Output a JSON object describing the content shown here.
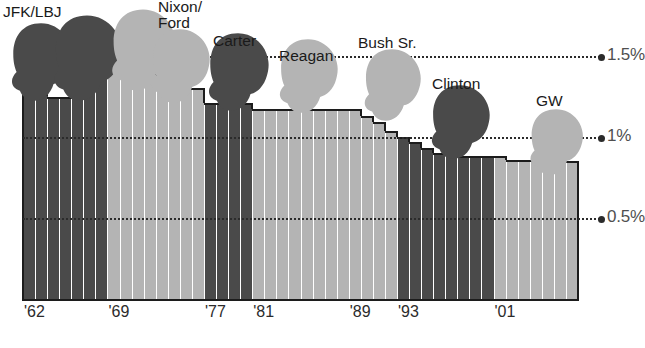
{
  "chart_data": {
    "type": "bar",
    "title_fragment_visible": "",
    "xlabel": "",
    "ylabel": "",
    "ylim": [
      0,
      1.75
    ],
    "grid": true,
    "legend_position": "none",
    "ytick_labels": [
      "1.5%",
      "1%",
      "0.5%"
    ],
    "ytick_values": [
      1.5,
      1.0,
      0.5
    ],
    "xtick_labels": [
      "'62",
      "'69",
      "'77",
      "'81",
      "'89",
      "'93",
      "'01"
    ],
    "xtick_years": [
      1962,
      1969,
      1977,
      1981,
      1989,
      1993,
      2001
    ],
    "x": [
      1962,
      1963,
      1964,
      1965,
      1966,
      1967,
      1968,
      1969,
      1970,
      1971,
      1972,
      1973,
      1974,
      1975,
      1976,
      1977,
      1978,
      1979,
      1980,
      1981,
      1982,
      1983,
      1984,
      1985,
      1986,
      1987,
      1988,
      1989,
      1990,
      1991,
      1992,
      1993,
      1994,
      1995,
      1996,
      1997,
      1998,
      1999,
      2000,
      2001,
      2002,
      2003,
      2004,
      2005,
      2006,
      2007
    ],
    "values": [
      1.33,
      1.33,
      1.25,
      1.25,
      1.25,
      1.4,
      1.4,
      1.52,
      1.52,
      1.52,
      1.46,
      1.38,
      1.38,
      1.3,
      1.3,
      1.21,
      1.21,
      1.21,
      1.21,
      1.17,
      1.17,
      1.17,
      1.17,
      1.17,
      1.17,
      1.17,
      1.17,
      1.17,
      1.13,
      1.09,
      1.04,
      1.0,
      0.97,
      0.93,
      0.9,
      0.9,
      0.88,
      0.88,
      0.88,
      0.88,
      0.86,
      0.86,
      0.86,
      0.85,
      0.85,
      0.85
    ],
    "series": [
      {
        "name": "Annual population growth rate",
        "values": [
          1.33,
          1.33,
          1.25,
          1.25,
          1.25,
          1.4,
          1.4,
          1.52,
          1.52,
          1.52,
          1.46,
          1.38,
          1.38,
          1.3,
          1.3,
          1.21,
          1.21,
          1.21,
          1.21,
          1.17,
          1.17,
          1.17,
          1.17,
          1.17,
          1.17,
          1.17,
          1.17,
          1.17,
          1.13,
          1.09,
          1.04,
          1.0,
          0.97,
          0.93,
          0.9,
          0.9,
          0.88,
          0.88,
          0.88,
          0.88,
          0.86,
          0.86,
          0.86,
          0.85,
          0.85,
          0.85
        ]
      }
    ],
    "administrations": [
      {
        "name": "JFK/LBJ",
        "label": "JFK/LBJ",
        "shade": "dark",
        "start_year": 1962,
        "end_year": 1968
      },
      {
        "name": "Nixon/Ford",
        "label": "Nixon/\nFord",
        "shade": "light",
        "start_year": 1969,
        "end_year": 1976
      },
      {
        "name": "Carter",
        "label": "Carter",
        "shade": "dark",
        "start_year": 1977,
        "end_year": 1980
      },
      {
        "name": "Reagan",
        "label": "Reagan",
        "shade": "light",
        "start_year": 1981,
        "end_year": 1988
      },
      {
        "name": "Bush Sr.",
        "label": "Bush Sr.",
        "shade": "light",
        "start_year": 1989,
        "end_year": 1992
      },
      {
        "name": "Clinton",
        "label": "Clinton",
        "shade": "dark",
        "start_year": 1993,
        "end_year": 2000
      },
      {
        "name": "GW",
        "label": "GW",
        "shade": "light",
        "start_year": 2001,
        "end_year": 2007
      }
    ],
    "colors": {
      "bar_dark": "#4a4a4a",
      "bar_light": "#b4b4b4",
      "bar_outline": "#1c1c1c",
      "gridline": "#2b2b2b",
      "ytick_text": "#4f4f4f",
      "xtick_text": "#2b2b2b",
      "background": "#ffffff",
      "head_dark": "#4a4a4a",
      "head_light": "#b4b4b4"
    }
  },
  "ytick_labels": [
    {
      "text": "1.5%"
    },
    {
      "text": "1%"
    },
    {
      "text": "0.5%"
    }
  ],
  "xtick_labels": [
    {
      "text": "'62"
    },
    {
      "text": "'69"
    },
    {
      "text": "'77"
    },
    {
      "text": "'81"
    },
    {
      "text": "'89"
    },
    {
      "text": "'93"
    },
    {
      "text": "'01"
    }
  ],
  "pres_labels": [
    {
      "text": "JFK/LBJ"
    },
    {
      "text": "Nixon/\nFord"
    },
    {
      "text": "Carter"
    },
    {
      "text": "Reagan"
    },
    {
      "text": "Bush Sr."
    },
    {
      "text": "Clinton"
    },
    {
      "text": "GW"
    }
  ]
}
